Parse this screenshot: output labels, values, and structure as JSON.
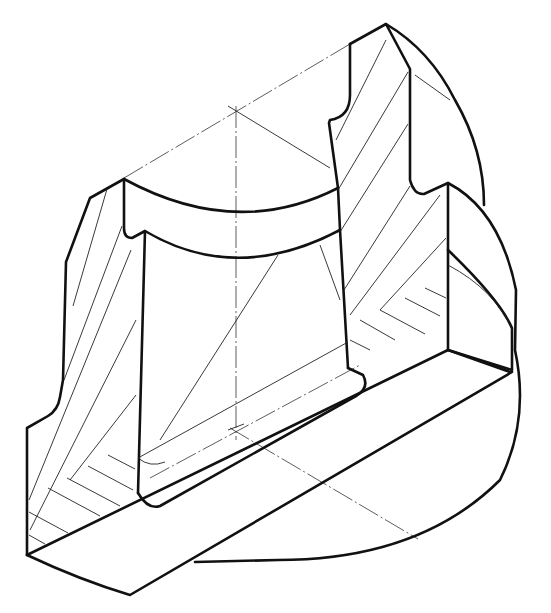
{
  "figure": {
    "type": "isometric sectional view",
    "line_color": "#111111",
    "background": "#ffffff"
  },
  "elements": {
    "outline": "thick visible edges",
    "section_hatching": "diagonal hatch lines on cut faces",
    "center_lines": "dash-dot axis lines of the bore and base"
  }
}
